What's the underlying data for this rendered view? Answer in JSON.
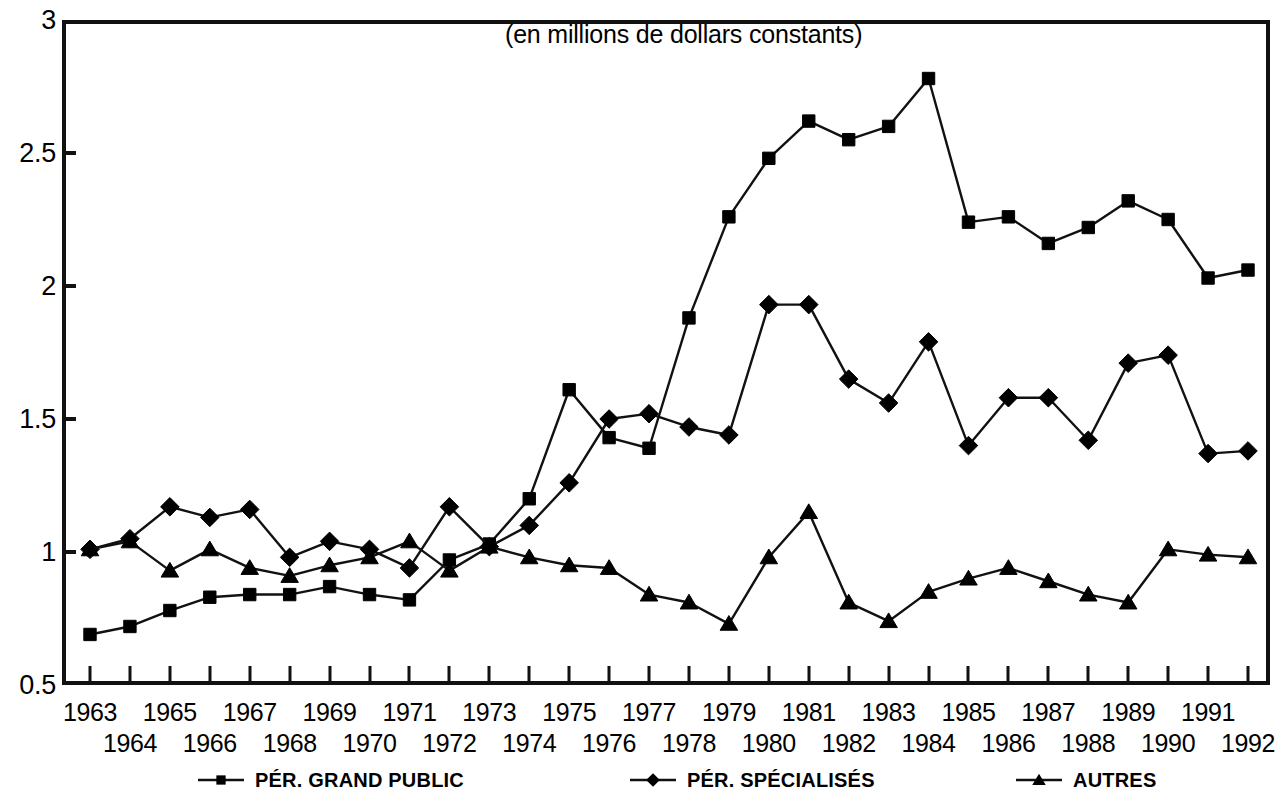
{
  "chart_data": {
    "type": "line",
    "title": "(en millions de dollars constants)",
    "xlabel": "",
    "ylabel": "",
    "ylim": [
      0.5,
      3
    ],
    "yticks": [
      0.5,
      1,
      1.5,
      2,
      2.5,
      3
    ],
    "ytick_labels": [
      "0.5",
      "1",
      "1.5",
      "2",
      "2.5",
      "3"
    ],
    "grid": false,
    "legend_position": "bottom",
    "categories": [
      "1963",
      "1964",
      "1965",
      "1966",
      "1967",
      "1968",
      "1969",
      "1970",
      "1971",
      "1972",
      "1973",
      "1974",
      "1975",
      "1976",
      "1977",
      "1978",
      "1979",
      "1980",
      "1981",
      "1982",
      "1983",
      "1984",
      "1985",
      "1986",
      "1987",
      "1988",
      "1989",
      "1990",
      "1991",
      "1992"
    ],
    "series": [
      {
        "name": "PÉR. GRAND PUBLIC",
        "marker": "square",
        "values": [
          0.69,
          0.72,
          0.78,
          0.83,
          0.84,
          0.84,
          0.87,
          0.84,
          0.82,
          0.97,
          1.03,
          1.2,
          1.61,
          1.43,
          1.39,
          1.88,
          2.26,
          2.48,
          2.62,
          2.55,
          2.6,
          2.78,
          2.24,
          2.26,
          2.16,
          2.22,
          2.32,
          2.25,
          2.03,
          2.06
        ]
      },
      {
        "name": "PÉR. SPÉCIALISÉS",
        "marker": "diamond",
        "values": [
          1.01,
          1.05,
          1.17,
          1.13,
          1.16,
          0.98,
          1.04,
          1.01,
          0.94,
          1.17,
          1.02,
          1.1,
          1.26,
          1.5,
          1.52,
          1.47,
          1.44,
          1.93,
          1.93,
          1.65,
          1.56,
          1.79,
          1.4,
          1.58,
          1.58,
          1.42,
          1.71,
          1.74,
          1.37,
          1.38
        ]
      },
      {
        "name": "AUTRES",
        "marker": "triangle",
        "values": [
          1.01,
          1.04,
          0.93,
          1.01,
          0.94,
          0.91,
          0.95,
          0.98,
          1.04,
          0.93,
          1.02,
          0.98,
          0.95,
          0.94,
          0.84,
          0.81,
          0.73,
          0.98,
          1.15,
          0.81,
          0.74,
          0.85,
          0.9,
          0.94,
          0.89,
          0.84,
          0.81,
          1.01,
          0.99,
          0.98
        ]
      }
    ]
  },
  "legend": {
    "items": [
      {
        "label": "PÉR. GRAND PUBLIC",
        "marker": "square"
      },
      {
        "label": "PÉR. SPÉCIALISÉS",
        "marker": "diamond"
      },
      {
        "label": "AUTRES",
        "marker": "triangle"
      }
    ]
  },
  "colors": {
    "line": "#111111",
    "marker": "#000000",
    "axis": "#111111",
    "background": "#ffffff"
  }
}
